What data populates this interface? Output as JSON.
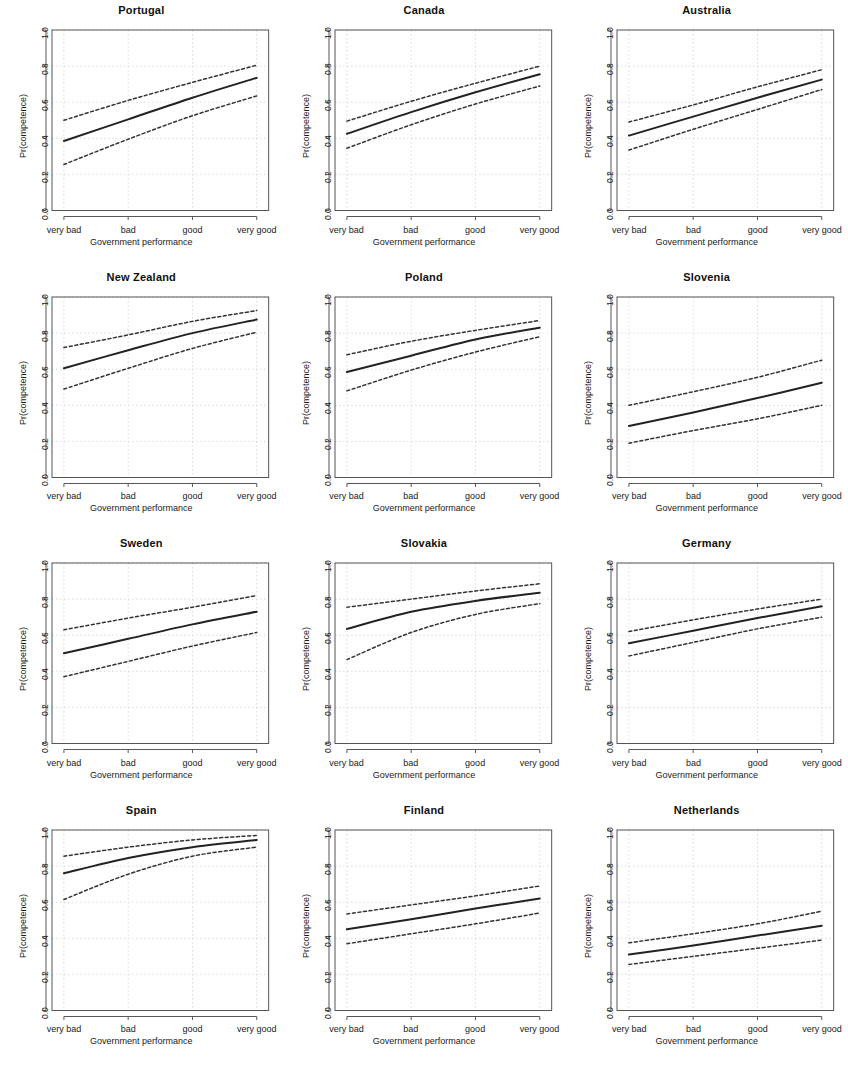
{
  "figure": {
    "xlabel": "Government performance",
    "ylabel": "Pr(competence)",
    "x_ticklabels": [
      "very bad",
      "bad",
      "good",
      "very good"
    ],
    "y_ticklabels": [
      "0.0",
      "0.2",
      "0.4",
      "0.6",
      "0.8",
      "1.0"
    ],
    "line_color": "#222222",
    "ci_color": "#333333",
    "grid_color": "#cccccc",
    "axis_color": "#555555"
  },
  "chart_data": [
    {
      "type": "line",
      "title": "Portugal",
      "xlabel": "Government performance",
      "ylabel": "Pr(competence)",
      "categories": [
        "very bad",
        "bad",
        "good",
        "very good"
      ],
      "ylim": [
        0.0,
        1.0
      ],
      "grid": true,
      "legend": "none",
      "series": [
        {
          "name": "upper 95% CI",
          "style": "dashed",
          "values": [
            0.5,
            0.61,
            0.71,
            0.805
          ]
        },
        {
          "name": "predicted probability",
          "style": "solid",
          "values": [
            0.385,
            0.505,
            0.625,
            0.735
          ]
        },
        {
          "name": "lower 95% CI",
          "style": "dashed",
          "values": [
            0.255,
            0.395,
            0.525,
            0.635
          ]
        }
      ]
    },
    {
      "type": "line",
      "title": "Canada",
      "xlabel": "Government performance",
      "ylabel": "Pr(competence)",
      "categories": [
        "very bad",
        "bad",
        "good",
        "very good"
      ],
      "ylim": [
        0.0,
        1.0
      ],
      "grid": true,
      "legend": "none",
      "series": [
        {
          "name": "upper 95% CI",
          "style": "dashed",
          "values": [
            0.495,
            0.605,
            0.705,
            0.8
          ]
        },
        {
          "name": "predicted probability",
          "style": "solid",
          "values": [
            0.425,
            0.545,
            0.655,
            0.755
          ]
        },
        {
          "name": "lower 95% CI",
          "style": "dashed",
          "values": [
            0.345,
            0.475,
            0.59,
            0.69
          ]
        }
      ]
    },
    {
      "type": "line",
      "title": "Australia",
      "xlabel": "Government performance",
      "ylabel": "Pr(competence)",
      "categories": [
        "very bad",
        "bad",
        "good",
        "very good"
      ],
      "ylim": [
        0.0,
        1.0
      ],
      "grid": true,
      "legend": "none",
      "series": [
        {
          "name": "upper 95% CI",
          "style": "dashed",
          "values": [
            0.49,
            0.585,
            0.685,
            0.78
          ]
        },
        {
          "name": "predicted probability",
          "style": "solid",
          "values": [
            0.415,
            0.52,
            0.625,
            0.725
          ]
        },
        {
          "name": "lower 95% CI",
          "style": "dashed",
          "values": [
            0.335,
            0.45,
            0.56,
            0.67
          ]
        }
      ]
    },
    {
      "type": "line",
      "title": "New Zealand",
      "xlabel": "Government performance",
      "ylabel": "Pr(competence)",
      "categories": [
        "very bad",
        "bad",
        "good",
        "very good"
      ],
      "ylim": [
        0.0,
        1.0
      ],
      "grid": true,
      "legend": "none",
      "series": [
        {
          "name": "upper 95% CI",
          "style": "dashed",
          "values": [
            0.72,
            0.79,
            0.865,
            0.925
          ]
        },
        {
          "name": "predicted probability",
          "style": "solid",
          "values": [
            0.605,
            0.705,
            0.8,
            0.875
          ]
        },
        {
          "name": "lower 95% CI",
          "style": "dashed",
          "values": [
            0.49,
            0.605,
            0.715,
            0.805
          ]
        }
      ]
    },
    {
      "type": "line",
      "title": "Poland",
      "xlabel": "Government performance",
      "ylabel": "Pr(competence)",
      "categories": [
        "very bad",
        "bad",
        "good",
        "very good"
      ],
      "ylim": [
        0.0,
        1.0
      ],
      "grid": true,
      "legend": "none",
      "series": [
        {
          "name": "upper 95% CI",
          "style": "dashed",
          "values": [
            0.68,
            0.755,
            0.815,
            0.87
          ]
        },
        {
          "name": "predicted probability",
          "style": "solid",
          "values": [
            0.585,
            0.675,
            0.765,
            0.83
          ]
        },
        {
          "name": "lower 95% CI",
          "style": "dashed",
          "values": [
            0.48,
            0.595,
            0.695,
            0.78
          ]
        }
      ]
    },
    {
      "type": "line",
      "title": "Slovenia",
      "xlabel": "Government performance",
      "ylabel": "Pr(competence)",
      "categories": [
        "very bad",
        "bad",
        "good",
        "very good"
      ],
      "ylim": [
        0.0,
        1.0
      ],
      "grid": true,
      "legend": "none",
      "series": [
        {
          "name": "upper 95% CI",
          "style": "dashed",
          "values": [
            0.4,
            0.475,
            0.555,
            0.65
          ]
        },
        {
          "name": "predicted probability",
          "style": "solid",
          "values": [
            0.285,
            0.36,
            0.44,
            0.525
          ]
        },
        {
          "name": "lower 95% CI",
          "style": "dashed",
          "values": [
            0.19,
            0.26,
            0.325,
            0.4
          ]
        }
      ]
    },
    {
      "type": "line",
      "title": "Sweden",
      "xlabel": "Government performance",
      "ylabel": "Pr(competence)",
      "categories": [
        "very bad",
        "bad",
        "good",
        "very good"
      ],
      "ylim": [
        0.0,
        1.0
      ],
      "grid": true,
      "legend": "none",
      "series": [
        {
          "name": "upper 95% CI",
          "style": "dashed",
          "values": [
            0.63,
            0.695,
            0.755,
            0.82
          ]
        },
        {
          "name": "predicted probability",
          "style": "solid",
          "values": [
            0.5,
            0.58,
            0.66,
            0.73
          ]
        },
        {
          "name": "lower 95% CI",
          "style": "dashed",
          "values": [
            0.37,
            0.455,
            0.54,
            0.615
          ]
        }
      ]
    },
    {
      "type": "line",
      "title": "Slovakia",
      "xlabel": "Government performance",
      "ylabel": "Pr(competence)",
      "categories": [
        "very bad",
        "bad",
        "good",
        "very good"
      ],
      "ylim": [
        0.0,
        1.0
      ],
      "grid": true,
      "legend": "none",
      "series": [
        {
          "name": "upper 95% CI",
          "style": "dashed",
          "values": [
            0.755,
            0.8,
            0.845,
            0.885
          ]
        },
        {
          "name": "predicted probability",
          "style": "solid",
          "values": [
            0.635,
            0.73,
            0.79,
            0.835
          ]
        },
        {
          "name": "lower 95% CI",
          "style": "dashed",
          "values": [
            0.465,
            0.615,
            0.715,
            0.775
          ]
        }
      ]
    },
    {
      "type": "line",
      "title": "Germany",
      "xlabel": "Government performance",
      "ylabel": "Pr(competence)",
      "categories": [
        "very bad",
        "bad",
        "good",
        "very good"
      ],
      "ylim": [
        0.0,
        1.0
      ],
      "grid": true,
      "legend": "none",
      "series": [
        {
          "name": "upper 95% CI",
          "style": "dashed",
          "values": [
            0.62,
            0.685,
            0.745,
            0.8
          ]
        },
        {
          "name": "predicted probability",
          "style": "solid",
          "values": [
            0.555,
            0.625,
            0.695,
            0.76
          ]
        },
        {
          "name": "lower 95% CI",
          "style": "dashed",
          "values": [
            0.485,
            0.56,
            0.635,
            0.7
          ]
        }
      ]
    },
    {
      "type": "line",
      "title": "Spain",
      "xlabel": "Government performance",
      "ylabel": "Pr(competence)",
      "categories": [
        "very bad",
        "bad",
        "good",
        "very good"
      ],
      "ylim": [
        0.0,
        1.0
      ],
      "grid": true,
      "legend": "none",
      "series": [
        {
          "name": "upper 95% CI",
          "style": "dashed",
          "values": [
            0.855,
            0.905,
            0.945,
            0.97
          ]
        },
        {
          "name": "predicted probability",
          "style": "solid",
          "values": [
            0.76,
            0.845,
            0.905,
            0.945
          ]
        },
        {
          "name": "lower 95% CI",
          "style": "dashed",
          "values": [
            0.615,
            0.755,
            0.855,
            0.905
          ]
        }
      ]
    },
    {
      "type": "line",
      "title": "Finland",
      "xlabel": "Government performance",
      "ylabel": "Pr(competence)",
      "categories": [
        "very bad",
        "bad",
        "good",
        "very good"
      ],
      "ylim": [
        0.0,
        1.0
      ],
      "grid": true,
      "legend": "none",
      "series": [
        {
          "name": "upper 95% CI",
          "style": "dashed",
          "values": [
            0.535,
            0.585,
            0.635,
            0.69
          ]
        },
        {
          "name": "predicted probability",
          "style": "solid",
          "values": [
            0.45,
            0.505,
            0.565,
            0.62
          ]
        },
        {
          "name": "lower 95% CI",
          "style": "dashed",
          "values": [
            0.37,
            0.425,
            0.48,
            0.54
          ]
        }
      ]
    },
    {
      "type": "line",
      "title": "Netherlands",
      "xlabel": "Government performance",
      "ylabel": "Pr(competence)",
      "categories": [
        "very bad",
        "bad",
        "good",
        "very good"
      ],
      "ylim": [
        0.0,
        1.0
      ],
      "grid": true,
      "legend": "none",
      "series": [
        {
          "name": "upper 95% CI",
          "style": "dashed",
          "values": [
            0.375,
            0.425,
            0.48,
            0.55
          ]
        },
        {
          "name": "predicted probability",
          "style": "solid",
          "values": [
            0.31,
            0.36,
            0.415,
            0.47
          ]
        },
        {
          "name": "lower 95% CI",
          "style": "dashed",
          "values": [
            0.255,
            0.3,
            0.345,
            0.39
          ]
        }
      ]
    }
  ]
}
